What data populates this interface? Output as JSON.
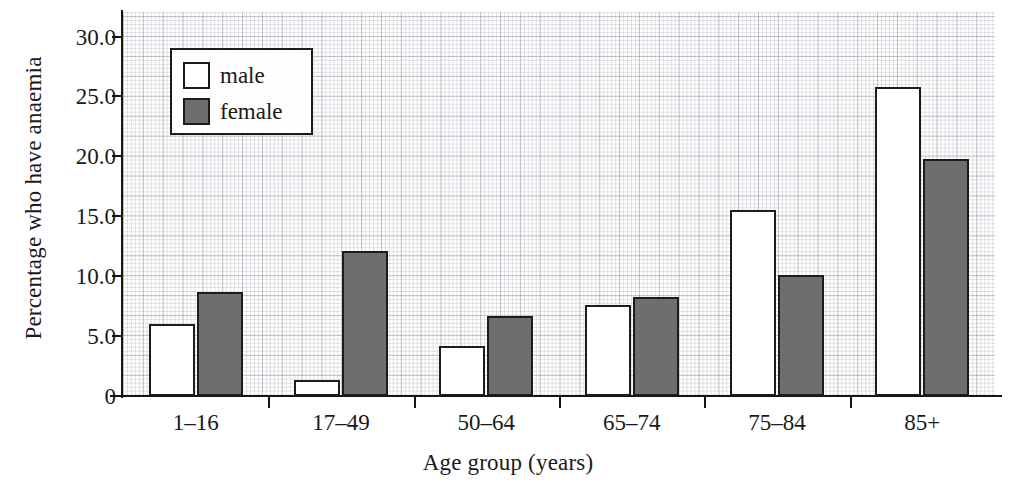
{
  "chart_data": {
    "type": "bar",
    "title": "",
    "xlabel": "Age group (years)",
    "ylabel": "Percentage who have anaemia",
    "categories": [
      "1–16",
      "17–49",
      "50–64",
      "65–74",
      "75–84",
      "85+"
    ],
    "series": [
      {
        "name": "male",
        "color": "#ffffff",
        "values": [
          6.0,
          1.3,
          4.2,
          7.6,
          15.5,
          25.8
        ]
      },
      {
        "name": "female",
        "color": "#6e6e6e",
        "values": [
          8.7,
          12.1,
          6.7,
          8.3,
          10.1,
          19.8
        ]
      }
    ],
    "ylim": [
      0,
      30
    ],
    "ytick_labels": [
      "0",
      "5.0",
      "10.0",
      "15.0",
      "20.0",
      "25.0",
      "30.0"
    ],
    "ytick_values": [
      0,
      5,
      10,
      15,
      20,
      25,
      30
    ],
    "grid": true,
    "grid_style": "fine graph paper, minor and major rules",
    "legend_position": "upper left inside axes",
    "legend_entries": [
      "male",
      "female"
    ]
  },
  "axes": {
    "y_title": "Percentage who have anaemia",
    "x_title": "Age group (years)"
  },
  "legend": {
    "rows": [
      {
        "label": "male"
      },
      {
        "label": "female"
      }
    ]
  }
}
